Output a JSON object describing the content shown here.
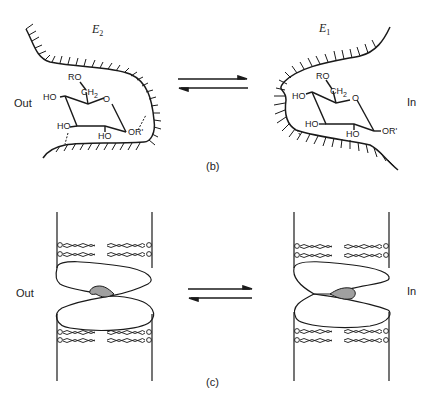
{
  "panels": {
    "b": {
      "caption": "(b)",
      "left_state": {
        "enzyme_letter": "E",
        "enzyme_sub": "2",
        "side_label": "Out"
      },
      "right_state": {
        "enzyme_letter": "E",
        "enzyme_sub": "1",
        "side_label": "In"
      },
      "sugar_labels": {
        "ro": "RO",
        "ch2": "CH",
        "ch2_sub": "2",
        "ring_o": "O",
        "ho1": "HO",
        "ho2": "HO",
        "ho3": "HO",
        "or": "OR'"
      }
    },
    "c": {
      "caption": "(c)",
      "left_side_label": "Out",
      "right_side_label": "In"
    }
  },
  "colors": {
    "line": "#1a1a1a",
    "ligand_fill": "#a0a0a0",
    "background": "#ffffff"
  }
}
